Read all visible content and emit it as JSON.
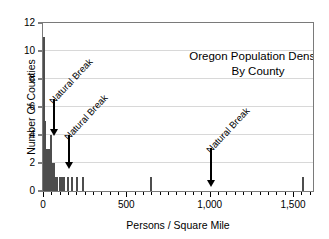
{
  "chart_data": {
    "type": "bar",
    "title": "Oregon Population Density By County",
    "title_lines": [
      "Oregon Population Density",
      "By County"
    ],
    "xlabel": "Persons / Square Mile",
    "ylabel": "Number Of Counties",
    "xlim": [
      0,
      1620
    ],
    "ylim": [
      0,
      12
    ],
    "grid": true,
    "legend": "none",
    "xticks": [
      0,
      500,
      1000,
      1500
    ],
    "xticklabels": [
      "0",
      "500",
      "1,000",
      "1,500"
    ],
    "xminor_step": 50,
    "yticks": [
      0,
      2,
      4,
      6,
      8,
      10,
      12
    ],
    "yticklabels": [
      "0",
      "2",
      "4",
      "6",
      "8",
      "10",
      "12"
    ],
    "bar_color": "#4d4d4d",
    "x": [
      5,
      14,
      22,
      30,
      38,
      46,
      55,
      63,
      72,
      86,
      100,
      112,
      128,
      152,
      175,
      205,
      240,
      650,
      1560
    ],
    "values": [
      11,
      5,
      3,
      3,
      3,
      4,
      2,
      2,
      1,
      1,
      1,
      1,
      1,
      1,
      1,
      1,
      1,
      1,
      1
    ],
    "categories": [
      "5",
      "14",
      "22",
      "30",
      "38",
      "46",
      "55",
      "63",
      "72",
      "86",
      "100",
      "112",
      "128",
      "152",
      "175",
      "205",
      "240",
      "650",
      "1560"
    ],
    "annotations": [
      {
        "text": "Natural Break",
        "x_value": 60,
        "arrow_top_y": 6.6,
        "arrow_bottom_y": 3.9,
        "label_rotation": -47
      },
      {
        "text": "Natural Break",
        "x_value": 150,
        "arrow_top_y": 4.0,
        "arrow_bottom_y": 1.6,
        "label_rotation": -47
      },
      {
        "text": "Natural Break",
        "x_value": 1000,
        "arrow_top_y": 3.1,
        "arrow_bottom_y": 0.25,
        "label_rotation": -47
      }
    ]
  }
}
